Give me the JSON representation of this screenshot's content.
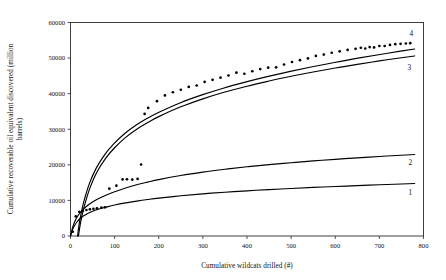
{
  "chart_data": {
    "type": "line",
    "title": "",
    "xlabel": "Cumulative wildcats drilled (#)",
    "ylabel": "Cumulative recoverable oil equivalent discovered (million barrels)",
    "ylabel_line1": "Cumulative recoverable oil equivalent discovered (million",
    "ylabel_line2": "barrels)",
    "xlim": [
      0,
      800
    ],
    "ylim": [
      0,
      60000
    ],
    "xticks": [
      0,
      100,
      200,
      300,
      400,
      500,
      600,
      700,
      800
    ],
    "yticks": [
      0,
      10000,
      20000,
      30000,
      40000,
      50000,
      60000
    ],
    "xtick_labels": [
      "0",
      "100",
      "200",
      "300",
      "400",
      "500",
      "600",
      "700",
      "800"
    ],
    "ytick_labels": [
      "0",
      "10000",
      "20000",
      "30000",
      "40000",
      "50000",
      "60000"
    ],
    "grid": false,
    "legend_position": "curve-end-labels",
    "series": [
      {
        "name": "1",
        "label": "1",
        "kind": "line",
        "label_value": 14400,
        "x": [
          0,
          5,
          10,
          15,
          20,
          25,
          30,
          40,
          50,
          65,
          80,
          100,
          125,
          150,
          175,
          200,
          250,
          300,
          350,
          400,
          450,
          500,
          550,
          600,
          650,
          700,
          750,
          780
        ],
        "y": [
          0,
          1900,
          3100,
          4000,
          4700,
          5250,
          5700,
          6400,
          6950,
          7600,
          8100,
          8700,
          9300,
          9800,
          10250,
          10650,
          11300,
          11850,
          12300,
          12700,
          13050,
          13350,
          13650,
          13900,
          14150,
          14400,
          14600,
          14750
        ]
      },
      {
        "name": "2",
        "label": "2",
        "kind": "line",
        "label_value": 22600,
        "x": [
          0,
          5,
          10,
          15,
          20,
          25,
          30,
          40,
          50,
          65,
          80,
          100,
          125,
          150,
          175,
          200,
          250,
          300,
          350,
          400,
          450,
          500,
          550,
          600,
          650,
          700,
          750,
          780
        ],
        "y": [
          0,
          2500,
          4150,
          5350,
          6250,
          7000,
          7650,
          8700,
          9550,
          10600,
          11450,
          12450,
          13500,
          14400,
          15150,
          15850,
          17000,
          17950,
          18750,
          19450,
          20050,
          20600,
          21100,
          21550,
          21950,
          22350,
          22700,
          22900
        ]
      },
      {
        "name": "3",
        "label": "3",
        "kind": "line",
        "label_value": 51000,
        "x": [
          18,
          22,
          28,
          35,
          45,
          60,
          80,
          100,
          125,
          150,
          175,
          200,
          250,
          300,
          350,
          400,
          450,
          500,
          550,
          600,
          650,
          700,
          750,
          780
        ],
        "y": [
          0,
          3200,
          6800,
          10000,
          13800,
          18000,
          21900,
          24800,
          27700,
          30000,
          31900,
          33550,
          36300,
          38550,
          40450,
          42100,
          43550,
          44900,
          46100,
          47200,
          48250,
          49200,
          50100,
          50600
        ]
      },
      {
        "name": "top-fit",
        "label": "",
        "kind": "line",
        "label_value": 52600,
        "x": [
          16,
          20,
          26,
          33,
          43,
          58,
          78,
          98,
          123,
          148,
          173,
          198,
          248,
          298,
          348,
          398,
          448,
          498,
          548,
          598,
          648,
          698,
          748,
          780
        ],
        "y": [
          0,
          3600,
          7500,
          10900,
          14800,
          19000,
          22950,
          25900,
          28800,
          31100,
          33000,
          34650,
          37400,
          39650,
          41600,
          43300,
          44850,
          46250,
          47550,
          48750,
          49900,
          50950,
          51950,
          52550
        ]
      },
      {
        "name": "4",
        "label": "4",
        "kind": "scatter",
        "label_value": 54000,
        "x": [
          5,
          12,
          20,
          28,
          36,
          44,
          52,
          60,
          70,
          78,
          88,
          104,
          118,
          128,
          140,
          152,
          160,
          168,
          176,
          196,
          214,
          232,
          250,
          268,
          286,
          304,
          322,
          340,
          358,
          376,
          394,
          412,
          430,
          448,
          466,
          484,
          502,
          520,
          538,
          556,
          574,
          592,
          610,
          628,
          646,
          658,
          668,
          678,
          688,
          700,
          712,
          724,
          736,
          748,
          760,
          770
        ],
        "y": [
          1200,
          5500,
          6800,
          7100,
          7300,
          7500,
          7650,
          7800,
          7950,
          8050,
          13300,
          14150,
          15900,
          15950,
          15850,
          16050,
          20100,
          34300,
          36000,
          37900,
          39500,
          40400,
          41100,
          41900,
          42300,
          43300,
          43900,
          44500,
          45100,
          45900,
          45600,
          46300,
          46900,
          47300,
          47400,
          48200,
          48900,
          49400,
          49900,
          50600,
          51000,
          51500,
          51900,
          52300,
          52600,
          52900,
          52700,
          53100,
          53000,
          53400,
          53400,
          53700,
          53900,
          54000,
          54100,
          54200
        ]
      }
    ]
  },
  "axes": {
    "x_title": "Cumulative wildcats drilled (#)",
    "y_title_line1": "Cumulative recoverable oil equivalent discovered (million",
    "y_title_line2": "barrels)"
  },
  "curve_labels": {
    "one": "1",
    "two": "2",
    "three": "3",
    "four": "4"
  }
}
